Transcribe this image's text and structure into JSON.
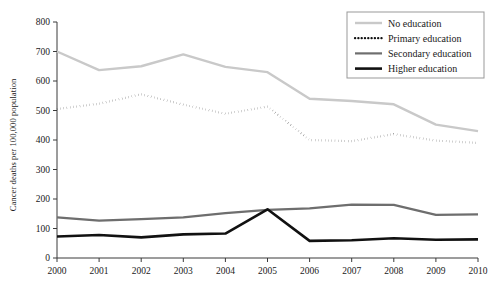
{
  "chart_data": {
    "type": "line",
    "title": "",
    "subtitle": "",
    "xlabel": "",
    "ylabel": "Cancer deaths per 100,000 population",
    "x": [
      2000,
      2001,
      2002,
      2003,
      2004,
      2005,
      2006,
      2007,
      2008,
      2009,
      2010
    ],
    "xtick_labels": [
      "2000",
      "2001",
      "2002",
      "2003",
      "2004",
      "2005",
      "2006",
      "2007",
      "2008",
      "2009",
      "2010"
    ],
    "ytick_labels": [
      "0",
      "100",
      "200",
      "300",
      "400",
      "500",
      "600",
      "700",
      "800"
    ],
    "yticks": [
      0,
      100,
      200,
      300,
      400,
      500,
      600,
      700,
      800
    ],
    "ylim": [
      0,
      800
    ],
    "xlim": [
      2000,
      2010
    ],
    "grid": false,
    "legend_position": "top-right",
    "series": [
      {
        "name": "No education",
        "color": "#c9c9c9",
        "style": "solid",
        "width": 2.4,
        "values": [
          700,
          637,
          650,
          690,
          648,
          630,
          540,
          532,
          521,
          452,
          430
        ]
      },
      {
        "name": "Primary education",
        "color": "#111111",
        "style": "dotted",
        "width": 2.2,
        "values": [
          505,
          523,
          555,
          520,
          489,
          513,
          400,
          396,
          420,
          398,
          390
        ]
      },
      {
        "name": "Secondary education",
        "color": "#6e6e6e",
        "style": "solid",
        "width": 2.2,
        "values": [
          138,
          127,
          132,
          138,
          152,
          163,
          168,
          181,
          180,
          146,
          148
        ]
      },
      {
        "name": "Higher education",
        "color": "#111111",
        "style": "solid",
        "width": 2.6,
        "values": [
          73,
          78,
          70,
          80,
          83,
          165,
          58,
          60,
          67,
          62,
          63
        ]
      }
    ]
  },
  "legend": {
    "entries": [
      {
        "label": "No education"
      },
      {
        "label": "Primary education"
      },
      {
        "label": "Secondary education"
      },
      {
        "label": "Higher education"
      }
    ]
  },
  "axes": {
    "y_axis_label": "Cancer deaths per 100,000 population"
  }
}
